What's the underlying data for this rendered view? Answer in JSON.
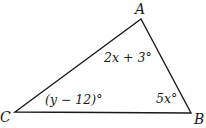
{
  "diagram": {
    "type": "triangle",
    "vertices": [
      {
        "name": "A",
        "label": "A"
      },
      {
        "name": "B",
        "label": "B"
      },
      {
        "name": "C",
        "label": "C"
      }
    ],
    "angles": {
      "A": "2x + 3°",
      "B": "5x°",
      "C": "(y − 12)°"
    },
    "stroke_color": "#1a1a1a"
  }
}
